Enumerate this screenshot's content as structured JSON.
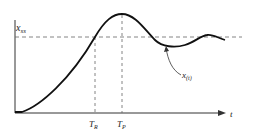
{
  "diagram": {
    "labels": {
      "steady_state": "x",
      "steady_state_sub": "ss",
      "curve": "x",
      "curve_sub": "(t)",
      "rise_time": "T",
      "rise_time_sub": "R",
      "peak_time": "T",
      "peak_time_sub": "P",
      "time_axis": "t"
    },
    "colors": {
      "line": "#1a1a1a",
      "dashed": "#555555",
      "background": "#ffffff"
    }
  }
}
